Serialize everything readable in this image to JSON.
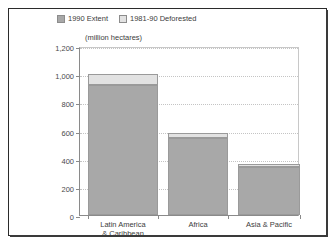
{
  "chart_data": {
    "type": "bar",
    "subtype": "stacked-vertical",
    "title": "",
    "xlabel": "",
    "ylabel": "(million hectares)",
    "axis_caption": "(million hectares)",
    "categories": [
      "Latin America & Caribbean",
      "Africa",
      "Asia & Pacific"
    ],
    "category_lines": [
      [
        "Latin America",
        "& Caribbean"
      ],
      [
        "Africa",
        ""
      ],
      [
        "Asia & Pacific",
        ""
      ]
    ],
    "series": [
      {
        "name": "1990 Extent",
        "values": [
          920,
          550,
          340
        ],
        "color": "#a8a8a8"
      },
      {
        "name": "1981-90 Deforested",
        "values": [
          80,
          30,
          22
        ],
        "color": "#e2e2e2"
      }
    ],
    "totals": [
      1000,
      580,
      362
    ],
    "ylim": [
      0,
      1200
    ],
    "yticks": [
      0,
      200,
      400,
      600,
      800,
      1000,
      1200
    ],
    "ytick_labels": [
      "0",
      "200",
      "400",
      "600",
      "800",
      "1,000",
      "1,200"
    ],
    "grid": true,
    "legend_position": "top-inside"
  },
  "legend": {
    "entries": [
      {
        "label": "1990 Extent",
        "color": "#a8a8a8"
      },
      {
        "label": "1981-90 Deforested",
        "color": "#e2e2e2"
      }
    ]
  },
  "colors": {
    "extent": "#a8a8a8",
    "deforested": "#e2e2e2",
    "bar_border": "#9a9a9a",
    "axis": "#8a8a8a",
    "grid": "#c4c4c4",
    "text": "#3c3c3c",
    "frame": "#2b2b2b",
    "background": "#ffffff"
  }
}
